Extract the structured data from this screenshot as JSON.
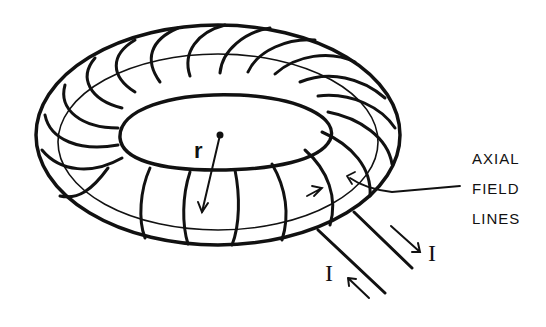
{
  "diagram": {
    "labels": {
      "radius": "r",
      "current_out": "I",
      "current_in": "I",
      "field_line_1": "AXIAL",
      "field_line_2": "FIELD",
      "field_line_3": "LINES"
    },
    "colors": {
      "ink": "#111111",
      "background": "#ffffff"
    }
  }
}
